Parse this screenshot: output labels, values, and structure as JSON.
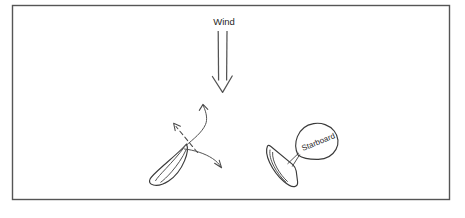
{
  "diagram": {
    "background_color": "#ffffff",
    "frame": {
      "name": "diagram-border",
      "stroke_color": "#555555",
      "x": 12,
      "y": 5,
      "width": 438,
      "height": 195
    },
    "wind": {
      "label": "Wind",
      "label_x": 224,
      "label_y": 24,
      "direction": "down",
      "arrow_color": "#545454",
      "shaft_top_y": 31,
      "shaft_bottom_y": 82,
      "shaft_left_x": 218,
      "shaft_right_x": 227,
      "head_tip_y": 92
    },
    "boats": [
      {
        "id": "port-tack-boat",
        "name": "left-boat",
        "label": "",
        "hull_color": "#3a3a3a",
        "center_x": 172,
        "center_y": 160,
        "heading": "up-right",
        "has_sail_balloon": false
      },
      {
        "id": "starboard-tack-boat",
        "name": "right-boat",
        "label": "Starboard",
        "hull_color": "#3a3a3a",
        "center_x": 288,
        "center_y": 163,
        "heading": "up-left",
        "has_sail_balloon": true,
        "balloon_text_rotation": -22,
        "balloon_text_x": 303,
        "balloon_text_y": 150
      }
    ],
    "arrows": [
      {
        "id": "dashed-course-arrow",
        "name": "dashed-course-arrow",
        "style": "dashed",
        "direction": "up-left",
        "from_x": 196,
        "from_y": 152,
        "to_x": 175,
        "to_y": 125,
        "color": "#4a4a4a"
      },
      {
        "id": "tack-up-arrow",
        "name": "curved-tack-arrow-up",
        "style": "curved-solid",
        "direction": "up-right",
        "from_x": 190,
        "from_y": 146,
        "to_x": 203,
        "to_y": 105,
        "color": "#4a4a4a"
      },
      {
        "id": "bear-away-arrow",
        "name": "curved-bear-away-arrow",
        "style": "curved-solid",
        "direction": "down-right",
        "from_x": 186,
        "from_y": 148,
        "to_x": 220,
        "to_y": 166,
        "color": "#4a4a4a"
      }
    ],
    "colors": {
      "ink": "#3a3a3a",
      "ink_light": "#4a4a4a",
      "frame": "#555555",
      "background": "#ffffff",
      "text": "#1f1f1f"
    }
  }
}
